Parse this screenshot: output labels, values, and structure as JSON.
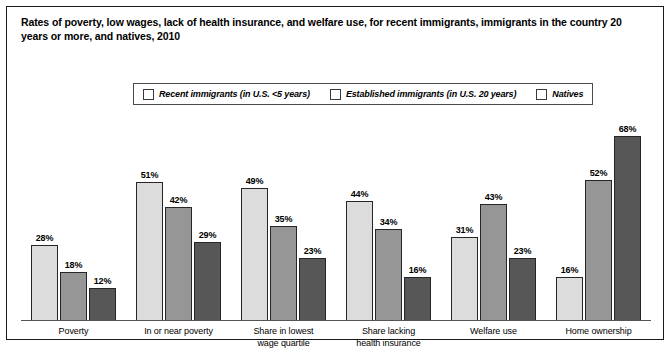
{
  "figure": {
    "title": "Rates of poverty, low wages, lack of health insurance, and welfare use, for recent immigrants, immigrants in the country 20 years or more, and natives, 2010"
  },
  "colors": {
    "series_recent": "#dcdcdc",
    "series_established": "#969696",
    "series_natives": "#575757",
    "border": "#262626",
    "frame": "#1a1a1a"
  },
  "chart_data": {
    "type": "bar",
    "title": "Rates of poverty, low wages, lack of health insurance, and welfare use, for recent immigrants, immigrants in the country 20 years or more, and natives, 2010",
    "xlabel": "",
    "ylabel": "",
    "ylim": [
      0,
      75
    ],
    "grid": false,
    "legend_position": "top-center",
    "value_suffix": "%",
    "categories": [
      "Poverty",
      "In or near poverty",
      "Share in lowest\nwage quartile",
      "Share lacking\nhealth insurance",
      "Welfare use",
      "Home ownership"
    ],
    "series": [
      {
        "name": "Recent immigrants (in U.S. <5 years)",
        "values": [
          28,
          51,
          49,
          44,
          31,
          16
        ],
        "labels": [
          "28%",
          "51%",
          "49%",
          "44%",
          "31%",
          "16%"
        ]
      },
      {
        "name": "Established immigrants (in U.S. 20 years)",
        "values": [
          18,
          42,
          35,
          34,
          43,
          52
        ],
        "labels": [
          "18%",
          "42%",
          "35%",
          "34%",
          "43%",
          "52%"
        ]
      },
      {
        "name": "Natives",
        "values": [
          12,
          29,
          23,
          16,
          23,
          68
        ],
        "labels": [
          "12%",
          "29%",
          "23%",
          "16%",
          "23%",
          "68%"
        ]
      }
    ]
  }
}
